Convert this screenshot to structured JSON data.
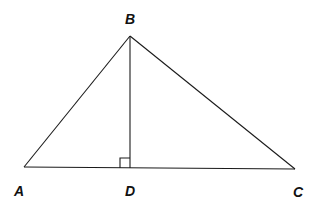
{
  "diagram": {
    "type": "geometry",
    "title": "",
    "colors": {
      "stroke": "#1a1a1a",
      "label": "#111111",
      "background": "#ffffff"
    },
    "points": {
      "A": {
        "label": "A",
        "x": 24,
        "y": 167
      },
      "B": {
        "label": "B",
        "x": 130,
        "y": 36
      },
      "C": {
        "label": "C",
        "x": 295,
        "y": 169
      },
      "D": {
        "label": "D",
        "x": 130,
        "y": 168
      }
    },
    "segments": [
      {
        "from": "A",
        "to": "B"
      },
      {
        "from": "B",
        "to": "C"
      },
      {
        "from": "A",
        "to": "C"
      },
      {
        "from": "B",
        "to": "D"
      }
    ],
    "right_angle_marker": {
      "at": "D",
      "between": [
        "B",
        "A"
      ]
    },
    "labels": {
      "A": "A",
      "B": "B",
      "C": "C",
      "D": "D"
    }
  }
}
